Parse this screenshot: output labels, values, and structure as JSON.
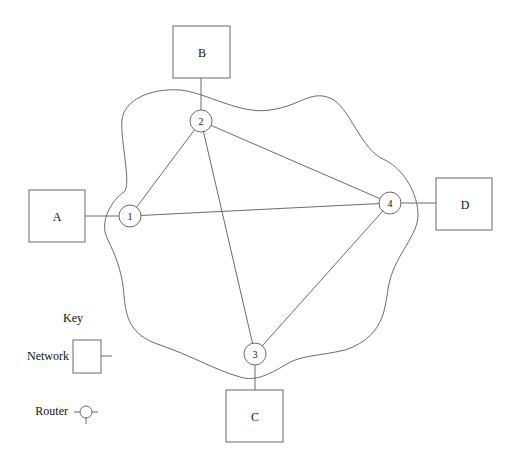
{
  "diagram": {
    "networks": [
      {
        "id": "A",
        "label": "A",
        "x": 29,
        "y": 190,
        "w": 56,
        "h": 52
      },
      {
        "id": "B",
        "label": "B",
        "x": 173,
        "y": 26,
        "w": 57,
        "h": 52
      },
      {
        "id": "C",
        "label": "C",
        "x": 226,
        "y": 390,
        "w": 57,
        "h": 52
      },
      {
        "id": "D",
        "label": "D",
        "x": 436,
        "y": 178,
        "w": 56,
        "h": 52
      }
    ],
    "routers": [
      {
        "id": "1",
        "label": "1",
        "cx": 130,
        "cy": 216
      },
      {
        "id": "2",
        "label": "2",
        "cx": 201,
        "cy": 121
      },
      {
        "id": "3",
        "label": "3",
        "cx": 255,
        "cy": 354
      },
      {
        "id": "4",
        "label": "4",
        "cx": 390,
        "cy": 203
      }
    ],
    "router_links": [
      [
        "1",
        "2"
      ],
      [
        "1",
        "4"
      ],
      [
        "2",
        "4"
      ],
      [
        "2",
        "3"
      ],
      [
        "3",
        "4"
      ]
    ],
    "network_links": [
      [
        "A",
        "1"
      ],
      [
        "B",
        "2"
      ],
      [
        "C",
        "3"
      ],
      [
        "D",
        "4"
      ]
    ]
  },
  "key": {
    "title": "Key",
    "network_label": "Network",
    "router_label": "Router"
  }
}
